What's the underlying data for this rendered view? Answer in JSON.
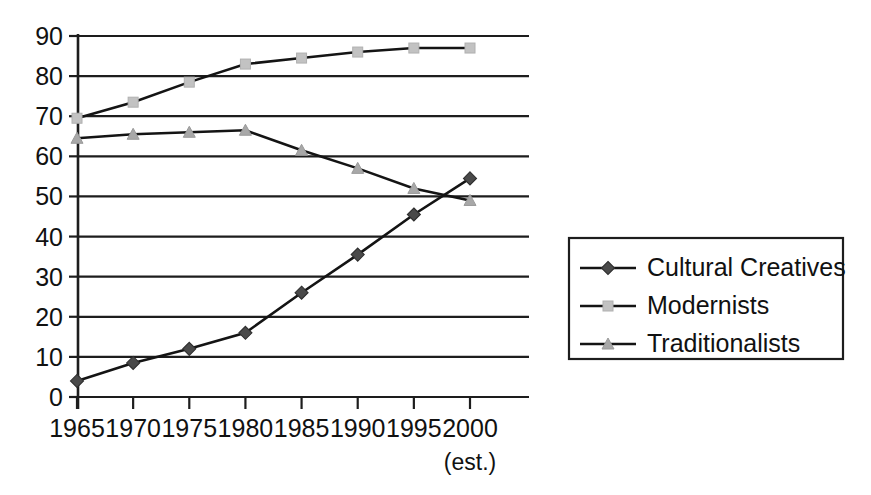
{
  "chart_data": {
    "type": "line",
    "title": "",
    "subtitle": "",
    "xlabel": "",
    "ylabel": "",
    "x": [
      1965,
      1970,
      1975,
      1980,
      1985,
      1990,
      1995,
      2000
    ],
    "categories": [
      "1965",
      "1970",
      "1975",
      "1980",
      "1985",
      "1990",
      "1995",
      "2000"
    ],
    "xtick_labels": [
      "1965",
      "1970",
      "1975",
      "1980",
      "1985",
      "1990",
      "1995",
      "2000"
    ],
    "xtick_note": "(est.)",
    "xtick_note_index": 7,
    "ytick_labels": [
      "0",
      "10",
      "20",
      "30",
      "40",
      "50",
      "60",
      "70",
      "80",
      "90"
    ],
    "ytick_values": [
      0,
      10,
      20,
      30,
      40,
      50,
      60,
      70,
      80,
      90
    ],
    "ylim": [
      0,
      90
    ],
    "xlim": [
      1965,
      2000
    ],
    "grid": "horizontal",
    "legend_position": "right",
    "series": [
      {
        "name": "Cultural Creatives",
        "marker": "diamond",
        "marker_color": "#4a4a4a",
        "line_color": "#141414",
        "values": [
          4,
          8.5,
          12,
          16,
          26,
          35.5,
          45.5,
          54.5
        ]
      },
      {
        "name": "Modernists",
        "marker": "square",
        "marker_color": "#c2c2c2",
        "line_color": "#141414",
        "values": [
          69.5,
          73.5,
          78.5,
          83,
          84.5,
          86,
          87,
          87
        ]
      },
      {
        "name": "Traditionalists",
        "marker": "triangle",
        "marker_color": "#a8a8a8",
        "line_color": "#141414",
        "values": [
          64.5,
          65.5,
          66,
          66.5,
          61.5,
          57,
          52,
          49
        ]
      }
    ]
  },
  "legend": {
    "items": [
      {
        "label": "Cultural Creatives"
      },
      {
        "label": "Modernists"
      },
      {
        "label": "Traditionalists"
      }
    ]
  },
  "colors": {
    "background": "#ffffff",
    "axis": "#1d1d1d",
    "line": "#141414",
    "cultural_creatives_marker": "#4a4a4a",
    "modernists_marker": "#c2c2c2",
    "traditionalists_marker": "#a8a8a8"
  }
}
